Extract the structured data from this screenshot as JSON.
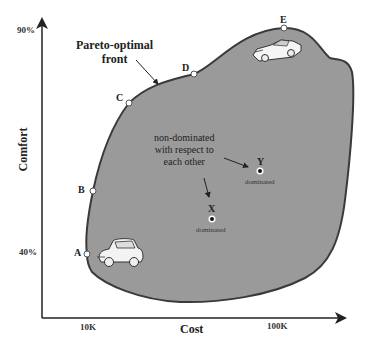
{
  "diagram": {
    "title": "Pareto-optimal front",
    "axes": {
      "y": {
        "label": "Comfort",
        "ticks": [
          "90%",
          "40%"
        ]
      },
      "x": {
        "label": "Cost",
        "ticks": [
          "10K",
          "100K"
        ]
      }
    },
    "front_label_line1": "Pareto-optimal",
    "front_label_line2": "front",
    "front_points": [
      {
        "id": "A",
        "label": "A"
      },
      {
        "id": "B",
        "label": "B"
      },
      {
        "id": "C",
        "label": "C"
      },
      {
        "id": "D",
        "label": "D"
      },
      {
        "id": "E",
        "label": "E"
      }
    ],
    "dominated_points": [
      {
        "id": "X",
        "label": "X",
        "note": "dominated"
      },
      {
        "id": "Y",
        "label": "Y",
        "note": "dominated"
      }
    ],
    "annotation_line1": "non-dominated",
    "annotation_line2": "with respect to",
    "annotation_line3": "each other",
    "icons": [
      "old-car-icon",
      "sports-car-icon"
    ],
    "colors": {
      "region_fill": "#9a9a9a",
      "region_stroke": "#3a3a3a",
      "axis": "#222222",
      "background": "#ffffff"
    }
  }
}
